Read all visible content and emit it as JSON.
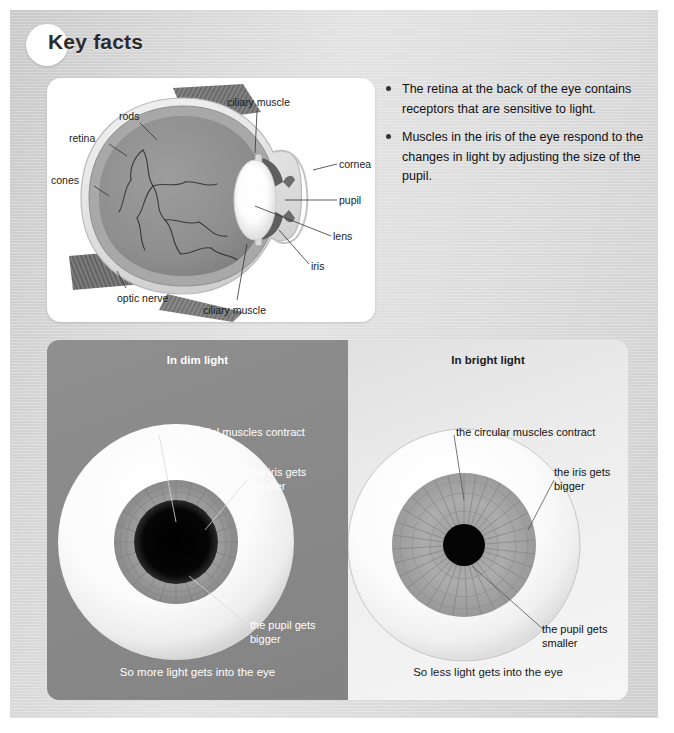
{
  "header": {
    "title": "Key facts",
    "badge_icon": "circle-badge-icon"
  },
  "key_facts": [
    "The retina at the back of the eye contains receptors that are sensitive to light.",
    "Muscles in the iris of the eye respond to the changes in light by adjusting the size of the pupil."
  ],
  "anatomy_diagram": {
    "caption_alt": "cross-section of the human eye",
    "labels": {
      "rods": "rods",
      "retina": "retina",
      "cones": "cones",
      "optic_nerve": "optic nerve",
      "ciliary_muscle_top": "ciliary muscle",
      "ciliary_muscle_bottom": "ciliary muscle",
      "cornea": "cornea",
      "pupil": "pupil",
      "lens": "lens",
      "iris": "iris"
    }
  },
  "panels": {
    "dim": {
      "title": "In dim light",
      "label_muscles": "the radial muscles contract",
      "label_iris": "the iris gets smaller",
      "label_pupil": "the pupil gets bigger",
      "footer": "So more light gets into the eye",
      "bg_color": "#8a8a8a",
      "text_color": "#ffffff"
    },
    "bright": {
      "title": "In bright light",
      "label_muscles": "the circular muscles contract",
      "label_iris": "the iris gets bigger",
      "label_pupil": "the pupil gets smaller",
      "footer": "So less light gets into the eye",
      "bg_color": "#eeeeee",
      "text_color": "#1a1a1a"
    }
  },
  "colors": {
    "page_bg": "#d8d8d8",
    "card_bg": "#ffffff",
    "iris_gray": "#9a9a9a",
    "pupil_black": "#060606",
    "sclera_white": "#ffffff"
  }
}
